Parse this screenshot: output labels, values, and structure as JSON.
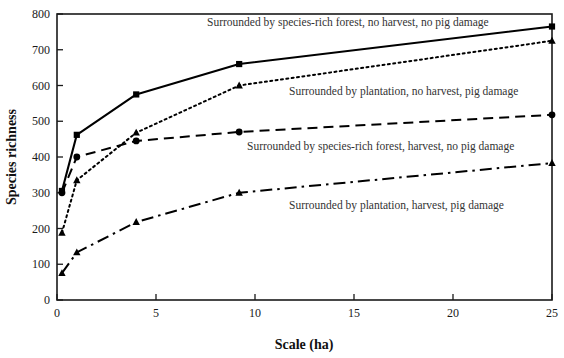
{
  "chart_data": {
    "type": "line",
    "title": "",
    "subtitle": "",
    "xlabel": "Scale (ha)",
    "ylabel": "Species richness",
    "xlim": [
      0,
      25
    ],
    "ylim": [
      0,
      800
    ],
    "xticks": [
      0,
      5,
      10,
      15,
      20,
      25
    ],
    "yticks": [
      0,
      100,
      200,
      300,
      400,
      500,
      600,
      700,
      800
    ],
    "xtick_labels": [
      "0",
      "5",
      "10",
      "15",
      "20",
      "25"
    ],
    "ytick_labels": [
      "0",
      "100",
      "200",
      "300",
      "400",
      "500",
      "600",
      "700",
      "800"
    ],
    "grid": false,
    "legend_position": "inline-annotations",
    "series": [
      {
        "name": "Surrounded by species-rich forest, no harvest, no pig damage",
        "marker": "square",
        "line_style": "solid",
        "color": "#000000",
        "x": [
          0.25,
          1,
          4,
          9.2,
          25
        ],
        "values": [
          305,
          462,
          575,
          660,
          765
        ]
      },
      {
        "name": "Surrounded by plantation, no harvest, pig damage",
        "marker": "triangle",
        "line_style": "dotted",
        "color": "#000000",
        "x": [
          0.25,
          1,
          4,
          9.2,
          25
        ],
        "values": [
          188,
          335,
          468,
          600,
          725
        ]
      },
      {
        "name": "Surrounded by species-rich forest, harvest, no pig damage",
        "marker": "circle",
        "line_style": "dashed",
        "color": "#000000",
        "x": [
          0.25,
          1,
          4,
          9.2,
          25
        ],
        "values": [
          300,
          400,
          445,
          470,
          518
        ]
      },
      {
        "name": "Surrounded by plantation, harvest, pig damage",
        "marker": "triangle",
        "line_style": "dash-dot",
        "color": "#000000",
        "x": [
          0.25,
          1,
          4,
          9.2,
          25
        ],
        "values": [
          75,
          133,
          218,
          300,
          383
        ]
      }
    ],
    "annotations": [
      {
        "text": "Surrounded by species-rich forest, no harvest, no pig damage",
        "x_px": 207,
        "y_px": 26
      },
      {
        "text": "Surrounded by plantation, no harvest, pig damage",
        "x_px": 289,
        "y_px": 95
      },
      {
        "text": "Surrounded by species-rich forest, harvest, no pig damage",
        "x_px": 247,
        "y_px": 150
      },
      {
        "text": "Surrounded by plantation, harvest, pig damage",
        "x_px": 289,
        "y_px": 209
      }
    ]
  },
  "axes": {
    "x_axis_title": "Scale (ha)",
    "y_axis_title": "Species richness"
  }
}
